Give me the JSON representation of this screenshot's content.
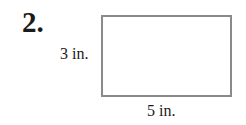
{
  "problem": {
    "number": "2.",
    "shape": "rectangle",
    "height_label": "3 in.",
    "width_label": "5 in.",
    "border_color": "#8a8a8a"
  }
}
